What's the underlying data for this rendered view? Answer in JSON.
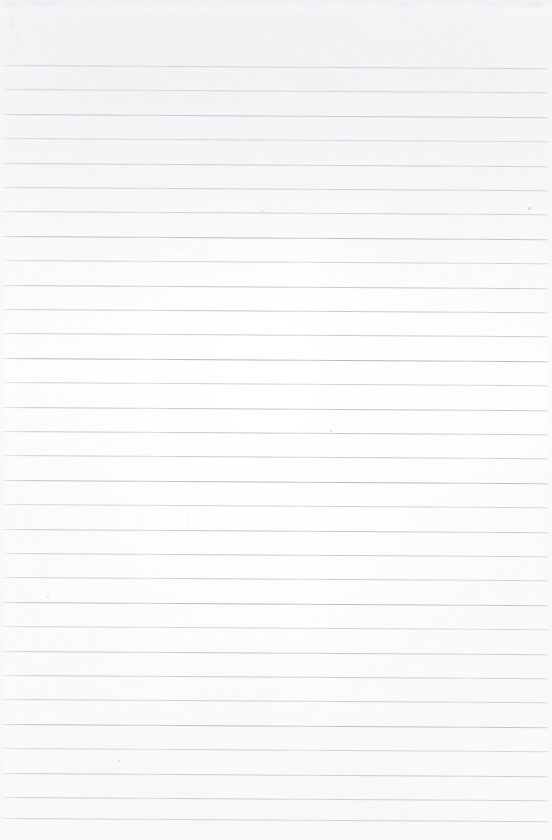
{
  "document": {
    "kind": "scanned-lined-notebook-page",
    "title": "Blank ruled notebook page",
    "page_width_px": 552,
    "page_height_px": 840,
    "paper_color": "#fefefe",
    "rule_color": "#b9bdc4",
    "text_content": "",
    "has_handwriting": false,
    "has_printed_text": false
  },
  "ruling": {
    "style": "horizontal-ruled",
    "line_count": 31,
    "line_spacing_px": 24.4,
    "first_line_y_px": 65,
    "last_line_y_px": 818,
    "line_left_x_px": 3,
    "line_right_x_px": 548,
    "line_thickness_px": 1,
    "skew_degrees": 0.35,
    "margin_rule": "none",
    "lines": [
      {
        "index": 1,
        "y": 65
      },
      {
        "index": 2,
        "y": 89
      },
      {
        "index": 3,
        "y": 114
      },
      {
        "index": 4,
        "y": 138
      },
      {
        "index": 5,
        "y": 163
      },
      {
        "index": 6,
        "y": 187
      },
      {
        "index": 7,
        "y": 211
      },
      {
        "index": 8,
        "y": 236
      },
      {
        "index": 9,
        "y": 260
      },
      {
        "index": 10,
        "y": 285
      },
      {
        "index": 11,
        "y": 309
      },
      {
        "index": 12,
        "y": 333
      },
      {
        "index": 13,
        "y": 358
      },
      {
        "index": 14,
        "y": 382
      },
      {
        "index": 15,
        "y": 407
      },
      {
        "index": 16,
        "y": 431
      },
      {
        "index": 17,
        "y": 455
      },
      {
        "index": 18,
        "y": 480
      },
      {
        "index": 19,
        "y": 504
      },
      {
        "index": 20,
        "y": 529
      },
      {
        "index": 21,
        "y": 553
      },
      {
        "index": 22,
        "y": 577
      },
      {
        "index": 23,
        "y": 602
      },
      {
        "index": 24,
        "y": 626
      },
      {
        "index": 25,
        "y": 651
      },
      {
        "index": 26,
        "y": 675
      },
      {
        "index": 27,
        "y": 699
      },
      {
        "index": 28,
        "y": 724
      },
      {
        "index": 29,
        "y": 748
      },
      {
        "index": 30,
        "y": 773
      },
      {
        "index": 31,
        "y": 797
      },
      {
        "index": 32,
        "y": 818
      }
    ]
  },
  "scan_artifacts": {
    "top_edge_band": {
      "y": 0,
      "height_px": 16,
      "description": "mottled gray scanner edge band"
    },
    "specks": [
      {
        "x": 261,
        "y": 210,
        "size": 2
      },
      {
        "x": 528,
        "y": 207,
        "size": 3
      },
      {
        "x": 47,
        "y": 596,
        "size": 2
      },
      {
        "x": 330,
        "y": 430,
        "size": 2
      },
      {
        "x": 118,
        "y": 760,
        "size": 2
      }
    ]
  }
}
